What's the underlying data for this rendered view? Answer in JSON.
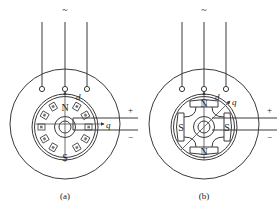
{
  "figures": [
    {
      "id": "a",
      "caption": "(a)",
      "supply_symbol": "~",
      "pole_top": "N",
      "pole_bottom": "S",
      "axis_d": "d",
      "axis_q": "q",
      "dc_plus": "+",
      "dc_minus": "−",
      "rotor_type": "non-salient (cylindrical) rotor with distributed field winding slots"
    },
    {
      "id": "b",
      "caption": "(b)",
      "supply_symbol": "~",
      "pole_top": "N",
      "pole_bottom": "N",
      "pole_left": "S",
      "pole_right": "S",
      "axis_d": "d",
      "axis_q": "q",
      "dc_plus": "+",
      "dc_minus": "−",
      "rotor_type": "salient-pole rotor (4 poles)"
    }
  ],
  "colors": {
    "line": "#3a3a3a",
    "background": "#ffffff"
  }
}
